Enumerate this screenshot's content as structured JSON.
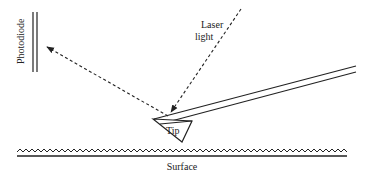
{
  "diagram": {
    "labels": {
      "photodiode": "Photodiode",
      "laser_line1": "Laser",
      "laser_line2": "light",
      "tip": "Tip",
      "surface": "Surface"
    },
    "colors": {
      "stroke": "#222222",
      "background": "#ffffff"
    }
  }
}
